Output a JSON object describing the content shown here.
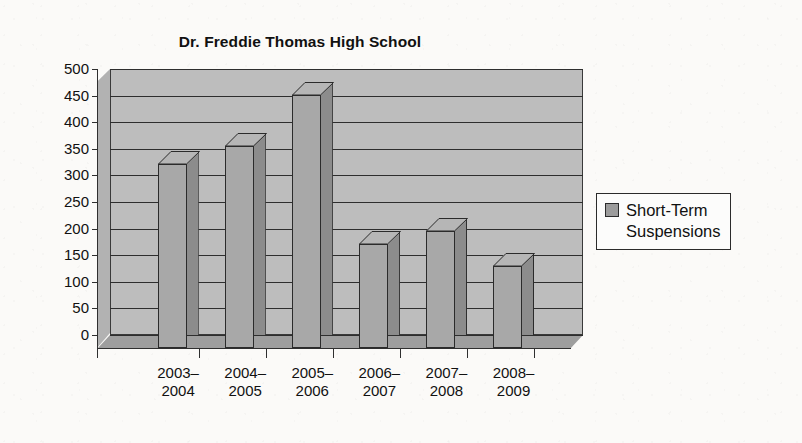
{
  "chart_data": {
    "type": "bar",
    "title": "Dr. Freddie Thomas High School",
    "xlabel": "",
    "ylabel": "",
    "ylim": [
      0,
      500
    ],
    "ytick_step": 50,
    "grid": true,
    "legend_position": "right",
    "style": "3d-column-grayscale",
    "categories": [
      "2003–\n2004",
      "2004–\n2005",
      "2005–\n2006",
      "2006–\n2007",
      "2007–\n2008",
      "2008–\n2009"
    ],
    "category_lines": [
      [
        "2003–",
        "2004"
      ],
      [
        "2004–",
        "2005"
      ],
      [
        "2005–",
        "2006"
      ],
      [
        "2006–",
        "2007"
      ],
      [
        "2007–",
        "2008"
      ],
      [
        "2008–",
        "2009"
      ]
    ],
    "yticks": [
      0,
      50,
      100,
      150,
      200,
      250,
      300,
      350,
      400,
      450,
      500
    ],
    "ytick_labels": [
      "0",
      "50",
      "100",
      "150",
      "200",
      "250",
      "300",
      "350",
      "400",
      "450",
      "500"
    ],
    "series": [
      {
        "name": "Short-Term Suspensions",
        "values": [
          345,
          380,
          475,
          195,
          220,
          155
        ]
      }
    ]
  },
  "legend": {
    "label": "Short-Term\nSuspensions",
    "swatch_color": "#9c9c9c"
  },
  "colors": {
    "bar_face": "#a8a8a8",
    "bar_top": "#b6b6b6",
    "bar_side": "#8c8c8c",
    "wall": "#bdbdbd",
    "floor": "#9e9e9e",
    "outline": "#2b2b2b",
    "page_background": "#fbfaf8",
    "text": "#111111"
  }
}
